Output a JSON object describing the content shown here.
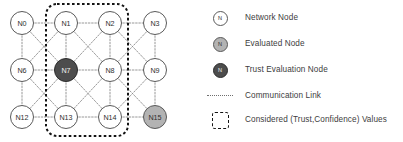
{
  "figure": {
    "colors": {
      "network_node_fill": "#ffffff",
      "evaluated_node_fill": "#b3b3b3",
      "trust_evaluation_node_fill": "#4d4d4d",
      "node_stroke": "#5a5a5a",
      "link_stroke": "#8c8c8c",
      "dash_box_stroke": "#141414",
      "label_text": "#2e2e2e",
      "dark_label_text": "#f2f2f2"
    },
    "graph": {
      "node_radius": 11.5,
      "label_font_size": 7.2,
      "columns_x": [
        22,
        66,
        110,
        155
      ],
      "rows_y": [
        23,
        70,
        117
      ],
      "nodes": [
        {
          "id": "N0",
          "label": "N0",
          "x": 22,
          "y": 23,
          "type": "network"
        },
        {
          "id": "N1",
          "label": "N1",
          "x": 66,
          "y": 23,
          "type": "network"
        },
        {
          "id": "N2",
          "label": "N2",
          "x": 110,
          "y": 23,
          "type": "network"
        },
        {
          "id": "N3",
          "label": "N3",
          "x": 155,
          "y": 23,
          "type": "network"
        },
        {
          "id": "N6",
          "label": "N6",
          "x": 22,
          "y": 70,
          "type": "network"
        },
        {
          "id": "N7",
          "label": "N7",
          "x": 66,
          "y": 70,
          "type": "trust_evaluation"
        },
        {
          "id": "N8",
          "label": "N8",
          "x": 110,
          "y": 70,
          "type": "network"
        },
        {
          "id": "N9",
          "label": "N9",
          "x": 155,
          "y": 70,
          "type": "network"
        },
        {
          "id": "N12",
          "label": "N12",
          "x": 22,
          "y": 117,
          "type": "network"
        },
        {
          "id": "N13",
          "label": "N13",
          "x": 66,
          "y": 117,
          "type": "network"
        },
        {
          "id": "N14",
          "label": "N14",
          "x": 110,
          "y": 117,
          "type": "network"
        },
        {
          "id": "N15",
          "label": "N15",
          "x": 155,
          "y": 117,
          "type": "evaluated"
        }
      ],
      "edges": [
        [
          "N0",
          "N1"
        ],
        [
          "N1",
          "N2"
        ],
        [
          "N2",
          "N3"
        ],
        [
          "N6",
          "N7"
        ],
        [
          "N7",
          "N8"
        ],
        [
          "N8",
          "N9"
        ],
        [
          "N12",
          "N13"
        ],
        [
          "N13",
          "N14"
        ],
        [
          "N14",
          "N15"
        ],
        [
          "N0",
          "N6"
        ],
        [
          "N1",
          "N7"
        ],
        [
          "N2",
          "N8"
        ],
        [
          "N3",
          "N9"
        ],
        [
          "N6",
          "N12"
        ],
        [
          "N7",
          "N13"
        ],
        [
          "N8",
          "N14"
        ],
        [
          "N9",
          "N15"
        ],
        [
          "N0",
          "N7"
        ],
        [
          "N1",
          "N6"
        ],
        [
          "N1",
          "N8"
        ],
        [
          "N2",
          "N7"
        ],
        [
          "N2",
          "N9"
        ],
        [
          "N3",
          "N8"
        ],
        [
          "N6",
          "N13"
        ],
        [
          "N7",
          "N12"
        ],
        [
          "N7",
          "N14"
        ],
        [
          "N8",
          "N13"
        ],
        [
          "N8",
          "N15"
        ],
        [
          "N9",
          "N14"
        ]
      ],
      "considered_region": {
        "label": "Considered (Trust,Confidence) Values",
        "x": 46,
        "y": 4,
        "width": 82,
        "height": 132,
        "corner_radius": 11
      }
    },
    "legend": {
      "rows": [
        {
          "icon": "network-node-icon",
          "icon_kind": "node",
          "node_letter": "N",
          "label": "Network Node",
          "y": 8
        },
        {
          "icon": "evaluated-node-icon",
          "icon_kind": "node",
          "node_letter": "N",
          "label": "Evaluated Node",
          "y": 34
        },
        {
          "icon": "trust-evaluation-node-icon",
          "icon_kind": "node",
          "node_letter": "N",
          "label": "Trust Evaluation Node",
          "y": 60
        },
        {
          "icon": "communication-link-icon",
          "icon_kind": "dots",
          "node_letter": "",
          "label": "Communication Link",
          "y": 86
        },
        {
          "icon": "considered-values-icon",
          "icon_kind": "dashbox",
          "node_letter": "",
          "label": "Considered (Trust,Confidence) Values",
          "y": 110
        }
      ]
    }
  }
}
